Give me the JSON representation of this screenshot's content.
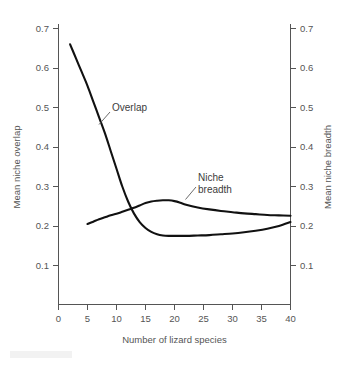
{
  "figure": {
    "background_color": "#ffffff",
    "curve_color": "#111111",
    "axis_color": "#555555",
    "text_color": "#555555"
  },
  "chart_data": {
    "type": "line",
    "title": "",
    "xlabel": "Number of lizard species",
    "ylabel": "Mean niche overlap",
    "y2label": "Mean niche breadth",
    "xlim": [
      0,
      40
    ],
    "ylim": [
      0.05,
      0.72
    ],
    "y2lim": [
      0.05,
      0.72
    ],
    "xticks": [
      0,
      5,
      10,
      15,
      20,
      25,
      30,
      35,
      40
    ],
    "xtick_labels": [
      "0",
      "5",
      "10",
      "15",
      "20",
      "25",
      "30",
      "35",
      "40"
    ],
    "yticks": [
      0.1,
      0.2,
      0.3,
      0.4,
      0.5,
      0.6,
      0.7
    ],
    "ytick_labels": [
      "0.1",
      "0.2",
      "0.3",
      "0.4",
      "0.5",
      "0.6",
      "0.7"
    ],
    "y2ticks": [
      0.1,
      0.2,
      0.3,
      0.4,
      0.5,
      0.6,
      0.7
    ],
    "y2tick_labels": [
      "0.1",
      "0.2",
      "0.3",
      "0.4",
      "0.5",
      "0.6",
      "0.7"
    ],
    "grid": false,
    "legend": "inline annotations",
    "series": [
      {
        "name": "Overlap",
        "axis": "left",
        "label_text": "Overlap",
        "x": [
          2,
          3,
          4,
          5,
          6,
          7,
          8,
          9,
          10,
          11,
          12,
          13,
          14,
          15,
          16,
          17,
          18,
          19,
          20,
          22,
          24,
          26,
          28,
          30,
          32,
          34,
          36,
          38,
          40
        ],
        "values": [
          0.66,
          0.625,
          0.59,
          0.555,
          0.515,
          0.475,
          0.435,
          0.39,
          0.345,
          0.3,
          0.262,
          0.232,
          0.21,
          0.195,
          0.185,
          0.179,
          0.176,
          0.175,
          0.175,
          0.175,
          0.176,
          0.177,
          0.179,
          0.181,
          0.184,
          0.188,
          0.193,
          0.2,
          0.21
        ]
      },
      {
        "name": "Niche breadth",
        "axis": "right",
        "label_text_line1": "Niche",
        "label_text_line2": "breadth",
        "x": [
          5,
          6,
          7,
          8,
          9,
          10,
          11,
          12,
          13,
          14,
          15,
          16,
          17,
          18,
          19,
          20,
          21,
          22,
          24,
          26,
          28,
          30,
          32,
          34,
          36,
          38,
          40
        ],
        "values": [
          0.205,
          0.211,
          0.217,
          0.222,
          0.227,
          0.231,
          0.236,
          0.241,
          0.246,
          0.252,
          0.258,
          0.262,
          0.264,
          0.265,
          0.265,
          0.263,
          0.259,
          0.254,
          0.247,
          0.242,
          0.238,
          0.235,
          0.232,
          0.23,
          0.228,
          0.227,
          0.226
        ]
      }
    ],
    "annotations": [
      {
        "text": "Overlap",
        "x_value": 8.5,
        "y_value": 0.455
      },
      {
        "text": "Niche breadth",
        "x_value": 24.5,
        "y_value": 0.315
      }
    ]
  }
}
